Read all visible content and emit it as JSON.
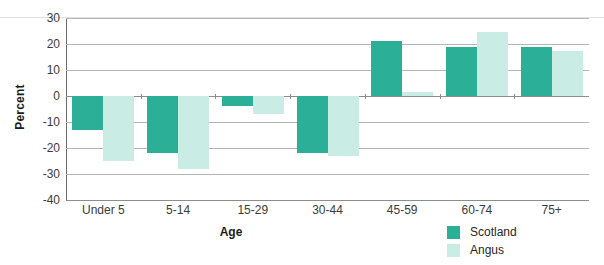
{
  "chart_data": {
    "type": "bar",
    "title": "",
    "xlabel": "Age",
    "ylabel": "Percent",
    "categories": [
      "Under 5",
      "5-14",
      "15-29",
      "30-44",
      "45-59",
      "60-74",
      "75+"
    ],
    "series": [
      {
        "name": "Scotland",
        "color": "#2CAF97",
        "values": [
          -13,
          -22,
          -4,
          -22,
          21,
          19,
          19
        ]
      },
      {
        "name": "Angus",
        "color": "#C9ECE4",
        "values": [
          -25,
          -28,
          -7,
          -23,
          1.5,
          24.5,
          17.5
        ]
      }
    ],
    "ylim": [
      -40,
      30
    ],
    "yticks": [
      30,
      20,
      10,
      0,
      -10,
      -20,
      -30,
      -40
    ],
    "ytick_labels": [
      "30",
      "20",
      "10",
      "0",
      "-10",
      "-20",
      "-30",
      "-40"
    ],
    "grid": true,
    "legend_position": "bottom-right",
    "orientation": "vertical"
  },
  "axes": {
    "y_title": "Percent",
    "x_title": "Age"
  },
  "legend": {
    "items": [
      {
        "label": "Scotland",
        "color": "#2CAF97"
      },
      {
        "label": "Angus",
        "color": "#C9ECE4"
      }
    ]
  }
}
